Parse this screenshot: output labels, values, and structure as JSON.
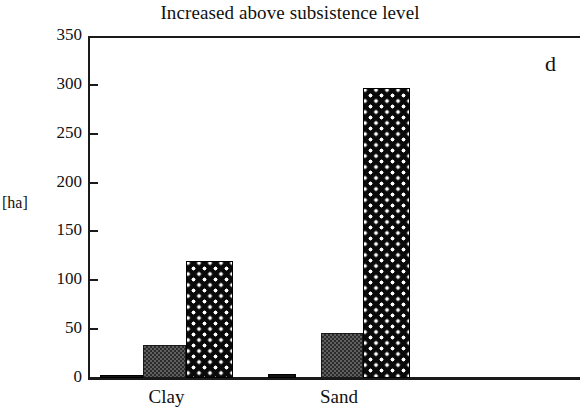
{
  "chart_data": {
    "type": "bar",
    "title": "Increased above subsistence level",
    "panel_label": "d",
    "xlabel": "",
    "ylabel": "[ha]",
    "ylim": [
      0,
      350
    ],
    "ytick_step": 50,
    "yticks": [
      350,
      300,
      250,
      200,
      150,
      100,
      50,
      0
    ],
    "ytick_labels": [
      "350",
      "300",
      "250",
      "200",
      "150",
      "100",
      "50",
      "0"
    ],
    "grid": false,
    "legend": "none",
    "categories": [
      "Clay",
      "Sand"
    ],
    "series": [
      {
        "name": "series-a",
        "pattern": "solid-black",
        "values": [
          1,
          4
        ]
      },
      {
        "name": "series-b",
        "pattern": "gray-checker",
        "values": [
          34,
          46
        ]
      },
      {
        "name": "series-c",
        "pattern": "black-with-white-diamonds",
        "values": [
          120,
          297
        ]
      }
    ]
  },
  "figure": {
    "title": "Increased above subsistence level",
    "panel_letter": "d",
    "unit_label": "[ha]",
    "categories": [
      {
        "label": "Clay"
      },
      {
        "label": "Sand"
      }
    ],
    "ytick_labels": [
      "350",
      "300",
      "250",
      "200",
      "150",
      "100",
      "50",
      "0"
    ]
  }
}
